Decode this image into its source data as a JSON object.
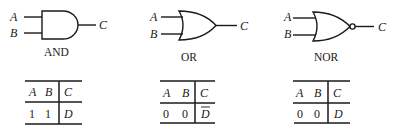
{
  "gates": [
    {
      "name": "AND",
      "inputs": [
        "A",
        "B"
      ],
      "output": "C",
      "truth_table": {
        "headers": [
          "A",
          "B",
          "C"
        ],
        "rows": [
          [
            "1",
            "1",
            "D"
          ]
        ],
        "output_negated": false
      }
    },
    {
      "name": "OR",
      "inputs": [
        "A",
        "B"
      ],
      "output": "C",
      "truth_table": {
        "headers": [
          "A",
          "B",
          "C"
        ],
        "rows": [
          [
            "0",
            "0",
            "D"
          ]
        ],
        "output_negated": true
      }
    },
    {
      "name": "NOR",
      "inputs": [
        "A",
        "B"
      ],
      "output": "C",
      "truth_table": {
        "headers": [
          "A",
          "B",
          "C"
        ],
        "rows": [
          [
            "0",
            "0",
            "D"
          ]
        ],
        "output_negated": false
      }
    }
  ]
}
